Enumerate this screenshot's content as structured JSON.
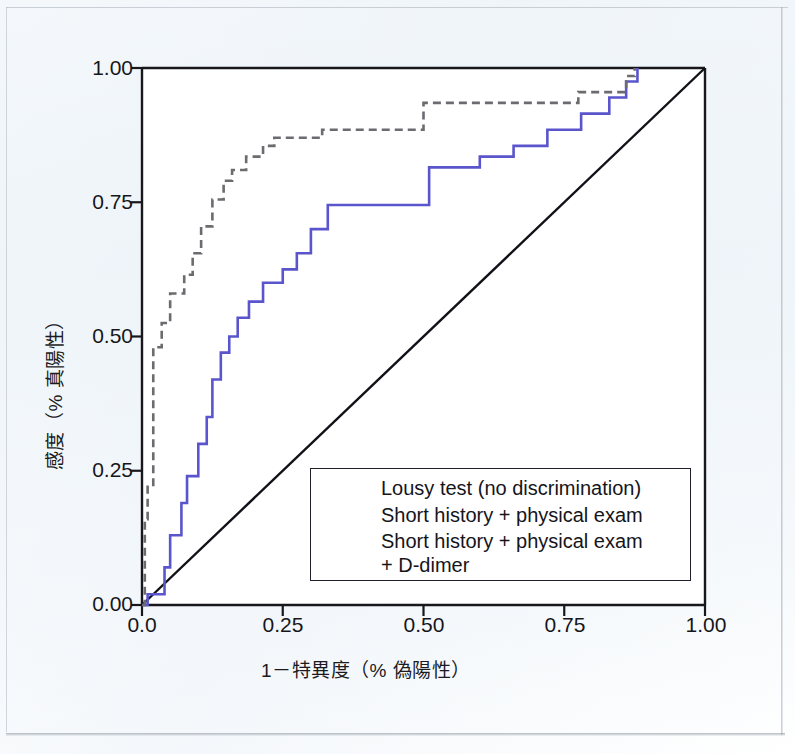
{
  "figure": {
    "background_color": "#f2f7fb",
    "plot_background": "#ffffff"
  },
  "axes": {
    "x_label": "1－特異度（% 偽陽性）",
    "y_label": "感度（% 真陽性）",
    "x_ticks": [
      "0.0",
      "0.25",
      "0.50",
      "0.75",
      "1.00"
    ],
    "y_ticks": [
      "0.00",
      "0.25",
      "0.50",
      "0.75",
      "1.00"
    ]
  },
  "legend": {
    "items": [
      {
        "label": "Lousy test (no discrimination)",
        "style": "solid",
        "color": "#111118"
      },
      {
        "label": "Short history + physical exam",
        "style": "solid",
        "color": "#5a55cc"
      },
      {
        "label": "Short history + physical exam",
        "style": "dashed",
        "color": "#6b6b70"
      }
    ],
    "continuation_label": "+ D-dimer"
  },
  "chart_data": {
    "type": "line",
    "title": "",
    "xlabel": "1－特異度（% 偽陽性）",
    "ylabel": "感度（% 真陽性）",
    "xlim": [
      0,
      1
    ],
    "ylim": [
      0,
      1
    ],
    "xticks": [
      0,
      0.25,
      0.5,
      0.75,
      1
    ],
    "yticks": [
      0,
      0.25,
      0.5,
      0.75,
      1
    ],
    "grid": false,
    "legend_position": "lower-right-inside",
    "series": [
      {
        "name": "Lousy test (no discrimination)",
        "color": "#111118",
        "style": "solid",
        "width": 2.4,
        "x": [
          0,
          1
        ],
        "y": [
          0,
          1
        ]
      },
      {
        "name": "Short history + physical exam",
        "color": "#5a55cc",
        "style": "solid",
        "width": 2.6,
        "step": "post",
        "x": [
          0.0,
          0.01,
          0.01,
          0.04,
          0.04,
          0.05,
          0.05,
          0.07,
          0.07,
          0.08,
          0.08,
          0.1,
          0.1,
          0.115,
          0.115,
          0.125,
          0.125,
          0.14,
          0.14,
          0.155,
          0.155,
          0.17,
          0.17,
          0.19,
          0.19,
          0.215,
          0.215,
          0.25,
          0.25,
          0.275,
          0.275,
          0.3,
          0.3,
          0.33,
          0.33,
          0.43,
          0.43,
          0.51,
          0.51,
          0.6,
          0.6,
          0.66,
          0.66,
          0.72,
          0.72,
          0.78,
          0.78,
          0.83,
          0.83,
          0.86,
          0.86,
          0.88,
          0.88
        ],
        "y": [
          0.0,
          0.0,
          0.02,
          0.02,
          0.07,
          0.07,
          0.13,
          0.13,
          0.19,
          0.19,
          0.24,
          0.24,
          0.3,
          0.3,
          0.35,
          0.35,
          0.42,
          0.42,
          0.47,
          0.47,
          0.5,
          0.5,
          0.535,
          0.535,
          0.565,
          0.565,
          0.6,
          0.6,
          0.625,
          0.625,
          0.655,
          0.655,
          0.7,
          0.7,
          0.745,
          0.745,
          0.745,
          0.745,
          0.815,
          0.815,
          0.835,
          0.835,
          0.855,
          0.855,
          0.885,
          0.885,
          0.915,
          0.915,
          0.945,
          0.945,
          0.975,
          0.975,
          1.0
        ]
      },
      {
        "name": "Short history + physical exam + D-dimer",
        "color": "#6b6b70",
        "style": "dashed",
        "width": 2.6,
        "step": "post",
        "x": [
          0.0,
          0.005,
          0.005,
          0.01,
          0.01,
          0.02,
          0.02,
          0.035,
          0.035,
          0.05,
          0.05,
          0.075,
          0.075,
          0.09,
          0.09,
          0.105,
          0.105,
          0.125,
          0.125,
          0.145,
          0.145,
          0.16,
          0.16,
          0.185,
          0.185,
          0.215,
          0.215,
          0.235,
          0.235,
          0.32,
          0.32,
          0.5,
          0.5,
          0.775,
          0.775,
          0.86,
          0.86,
          0.875,
          0.875
        ],
        "y": [
          0.0,
          0.0,
          0.16,
          0.16,
          0.22,
          0.22,
          0.48,
          0.48,
          0.525,
          0.525,
          0.58,
          0.58,
          0.615,
          0.615,
          0.655,
          0.655,
          0.705,
          0.705,
          0.755,
          0.755,
          0.79,
          0.79,
          0.81,
          0.81,
          0.835,
          0.835,
          0.855,
          0.855,
          0.87,
          0.87,
          0.885,
          0.885,
          0.935,
          0.935,
          0.955,
          0.955,
          0.985,
          0.985,
          1.0
        ]
      }
    ]
  }
}
